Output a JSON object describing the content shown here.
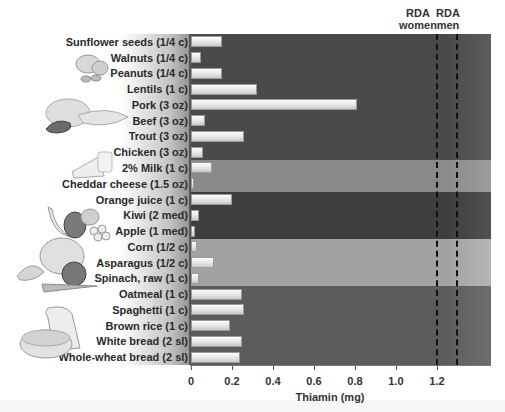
{
  "chart_data": {
    "type": "bar",
    "orientation": "horizontal",
    "title": "",
    "xlabel": "Thiamin (mg)",
    "ylabel": "",
    "xlim": [
      0,
      1.4
    ],
    "xticks": [
      "0",
      "0.2",
      "0.4",
      "0.6",
      "0.8",
      "1.0",
      "1.2"
    ],
    "categories": [
      "Sunflower seeds (1/4 c)",
      "Walnuts (1/4 c)",
      "Peanuts (1/4 c)",
      "Lentils (1 c)",
      "Pork (3 oz)",
      "Beef (3 oz)",
      "Trout (3 oz)",
      "Chicken (3 oz)",
      "2% Milk (1 c)",
      "Cheddar cheese (1.5 oz)",
      "Orange juice (1 c)",
      "Kiwi (2 med)",
      "Apple (1 med)",
      "Corn (1/2 c)",
      "Asparagus (1/2 c)",
      "Spinach, raw (1 c)",
      "Oatmeal (1 c)",
      "Spaghetti (1 c)",
      "Brown rice (1 c)",
      "White bread (2 sl)",
      "Whole-wheat bread (2 sl)"
    ],
    "values": [
      0.15,
      0.05,
      0.15,
      0.32,
      0.81,
      0.07,
      0.26,
      0.06,
      0.1,
      0.01,
      0.2,
      0.04,
      0.02,
      0.03,
      0.11,
      0.04,
      0.25,
      0.26,
      0.19,
      0.25,
      0.24
    ],
    "reference_lines": [
      {
        "label": "RDA women",
        "value": 1.1
      },
      {
        "label": "RDA men",
        "value": 1.2
      }
    ],
    "groups": [
      {
        "name": "Meats, legumes & nuts",
        "start": 0,
        "end": 7,
        "color": "#4a4a4a"
      },
      {
        "name": "Dairy",
        "start": 8,
        "end": 9,
        "color": "#8a8a8a"
      },
      {
        "name": "Fruits",
        "start": 10,
        "end": 12,
        "color": "#3e3e3e"
      },
      {
        "name": "Vegetables",
        "start": 13,
        "end": 15,
        "color": "#a2a2a2"
      },
      {
        "name": "Grains",
        "start": 16,
        "end": 20,
        "color": "#5c5c5c"
      }
    ],
    "grid": false,
    "legend": "none"
  },
  "rda": {
    "women_line1": "RDA",
    "women_line2": "women",
    "men_line1": "RDA",
    "men_line2": "men"
  },
  "axis": {
    "title": "Thiamin (mg)",
    "ticks": [
      "0",
      "0.2",
      "0.4",
      "0.6",
      "0.8",
      "1.0",
      "1.2"
    ]
  },
  "illustrations": [
    "nuts-icon",
    "meats-icon",
    "dairy-icon",
    "fruits-icon",
    "vegetables-icon",
    "grains-icon"
  ]
}
